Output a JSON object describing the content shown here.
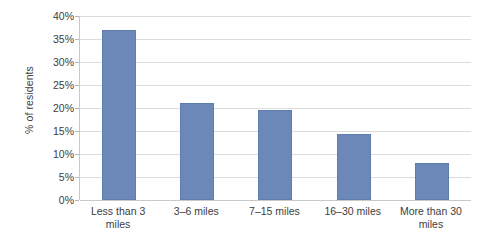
{
  "chart_data": {
    "type": "bar",
    "title": "",
    "xlabel": "",
    "ylabel": "% of residents",
    "categories": [
      "Less than 3 miles",
      "3–6 miles",
      "7–15 miles",
      "16–30 miles",
      "More than 30 miles"
    ],
    "values": [
      37,
      21,
      19.5,
      14.3,
      8
    ],
    "ylim": [
      0,
      40
    ],
    "ytick_values": [
      0,
      5,
      10,
      15,
      20,
      25,
      30,
      35,
      40
    ],
    "ytick_labels": [
      "0%",
      "5%",
      "10%",
      "15%",
      "20%",
      "25%",
      "30%",
      "35%",
      "40%"
    ],
    "grid": true,
    "legend": false,
    "bar_color": "#6b88b8",
    "gridline_color": "#dcdcdc",
    "axis_color": "#c9c9c9",
    "background_color": "#ffffff"
  }
}
